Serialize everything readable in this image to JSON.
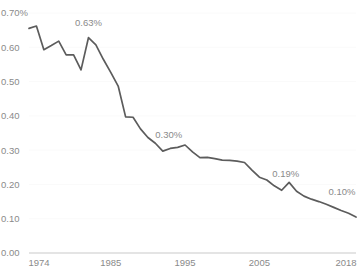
{
  "chart_data": {
    "type": "line",
    "title": "",
    "subtitle": "",
    "xlabel": "",
    "ylabel": "",
    "grid": true,
    "legend": "none",
    "xlim": [
      1974,
      2018
    ],
    "ylim": [
      0.0,
      0.7
    ],
    "y_ticks": [
      {
        "value": 0.7,
        "label": "0.70%"
      },
      {
        "value": 0.6,
        "label": "0.60"
      },
      {
        "value": 0.5,
        "label": "0.50"
      },
      {
        "value": 0.4,
        "label": "0.40"
      },
      {
        "value": 0.3,
        "label": "0.30"
      },
      {
        "value": 0.2,
        "label": "0.20"
      },
      {
        "value": 0.1,
        "label": "0.10"
      },
      {
        "value": 0.0,
        "label": "0.00"
      }
    ],
    "x_ticks": [
      {
        "value": 1974,
        "label": "1974"
      },
      {
        "value": 1985,
        "label": "1985"
      },
      {
        "value": 1995,
        "label": "1995"
      },
      {
        "value": 2005,
        "label": "2005"
      },
      {
        "value": 2018,
        "label": "2018"
      }
    ],
    "x": [
      1974,
      1975,
      1976,
      1977,
      1978,
      1979,
      1980,
      1981,
      1982,
      1983,
      1984,
      1985,
      1986,
      1987,
      1988,
      1989,
      1990,
      1991,
      1992,
      1993,
      1994,
      1995,
      1996,
      1997,
      1998,
      1999,
      2000,
      2001,
      2002,
      2003,
      2004,
      2005,
      2006,
      2007,
      2008,
      2009,
      2010,
      2011,
      2012,
      2013,
      2014,
      2015,
      2016,
      2017,
      2018
    ],
    "values": [
      0.655,
      0.662,
      0.593,
      0.605,
      0.618,
      0.578,
      0.578,
      0.534,
      0.628,
      0.607,
      0.565,
      0.527,
      0.487,
      0.397,
      0.396,
      0.362,
      0.337,
      0.32,
      0.297,
      0.305,
      0.308,
      0.315,
      0.295,
      0.278,
      0.279,
      0.275,
      0.271,
      0.27,
      0.268,
      0.264,
      0.242,
      0.221,
      0.213,
      0.196,
      0.183,
      0.206,
      0.18,
      0.166,
      0.157,
      0.15,
      0.142,
      0.133,
      0.124,
      0.116,
      0.105
    ],
    "series_name": "",
    "annotations": [
      {
        "label": "0.63%",
        "x": 1982,
        "y": 0.628
      },
      {
        "label": "0.30%",
        "x": 1992,
        "y": 0.297
      },
      {
        "label": "0.19%",
        "x": 2008,
        "y": 0.183
      },
      {
        "label": "0.10%",
        "x": 2018,
        "y": 0.105
      }
    ]
  }
}
